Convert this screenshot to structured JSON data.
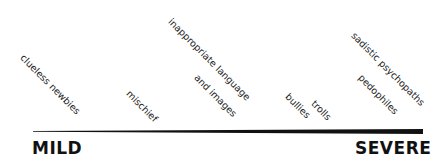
{
  "scale": {
    "min_label": "MILD",
    "max_label": "SEVERE",
    "items": [
      {
        "label": "clueless newbies",
        "severity": 0.07
      },
      {
        "label": "mischief",
        "severity": 0.3
      },
      {
        "label": "inappropriate language and images",
        "line1": "inappropriate language",
        "line2": "and images",
        "severity": 0.52
      },
      {
        "label": "bullies",
        "severity": 0.66
      },
      {
        "label": "trolls",
        "severity": 0.72
      },
      {
        "label": "pedophiles",
        "severity": 0.88
      },
      {
        "label": "sadistic psychopaths",
        "severity": 0.94
      }
    ],
    "line_color": "#111111"
  }
}
